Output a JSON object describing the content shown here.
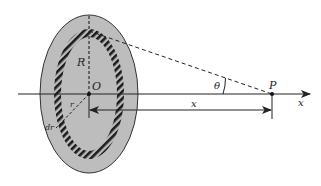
{
  "diagram": {
    "type": "physics-geometry",
    "labels": {
      "radius_big": "R",
      "center": "O",
      "ring_radius": "r",
      "ring_width": "dr",
      "angle": "θ",
      "point": "P",
      "distance": "x",
      "axis": "x"
    },
    "colors": {
      "disk_fill": "#bdbdbd",
      "stroke": "#222222",
      "background": "#ffffff"
    }
  }
}
